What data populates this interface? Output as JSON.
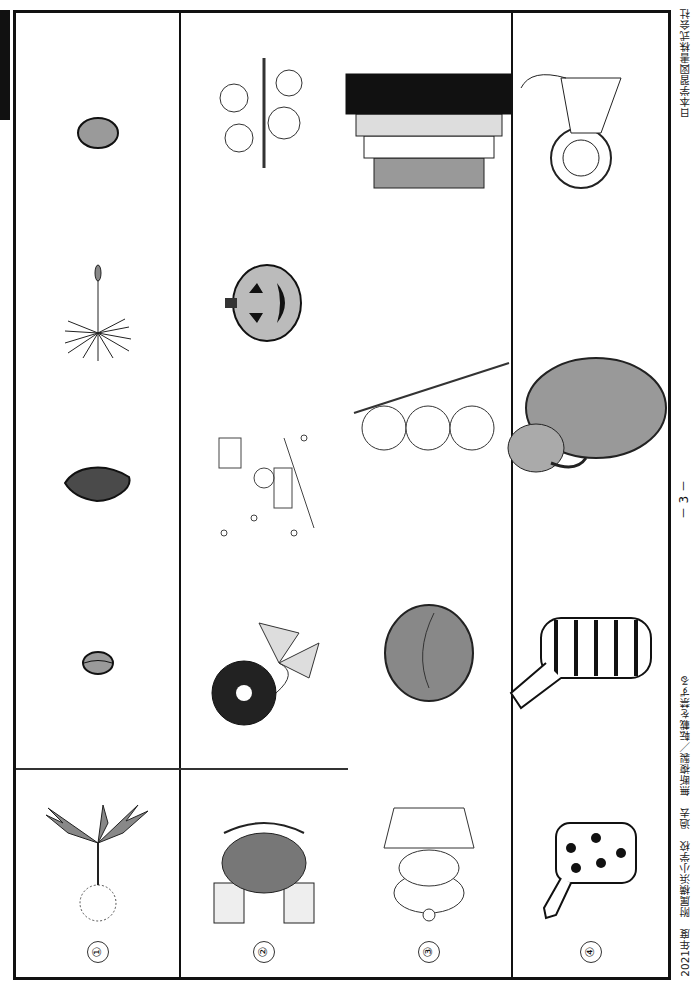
{
  "page": {
    "orientation": "rotated-90",
    "page_number": "－ 3 －",
    "footer_left": "2021年度　附属横浜小学校　過去　無断複製／転載を禁ずる",
    "footer_right": "日本学習図書株式会社",
    "title_fragment": "問題3"
  },
  "questions": [
    {
      "number": "①",
      "reference": "dandelion",
      "choices": [
        "seed-small-oval",
        "seed-dark-leaf",
        "dandelion-fluff",
        "seed-round"
      ]
    },
    {
      "number": "②",
      "reference": "kabuto-helmet",
      "choices": [
        "morning-glory",
        "snow-skiing",
        "jack-o-lantern",
        "cherry-blossom"
      ]
    },
    {
      "number": "③",
      "reference": "kagami-mochi",
      "choices": [
        "kashiwa-mochi",
        "dango",
        "jubako"
      ]
    },
    {
      "number": "④",
      "reference": "giraffe",
      "choices": [
        "zebra",
        "elephant",
        "lion"
      ]
    }
  ],
  "colors": {
    "line": "#111111",
    "gray_fill": "#9a9a9a",
    "dark_fill": "#4a4a4a"
  }
}
